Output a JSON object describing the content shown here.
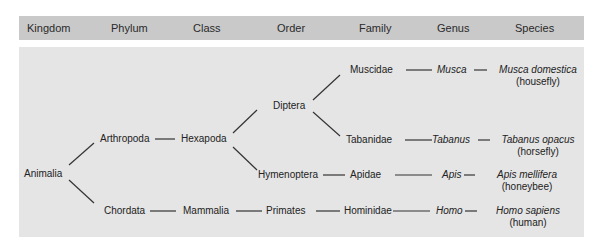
{
  "header": {
    "columns": [
      "Kingdom",
      "Phylum",
      "Class",
      "Order",
      "Family",
      "Genus",
      "Species"
    ]
  },
  "tree": {
    "kingdom": "Animalia",
    "phyla": [
      "Arthropoda",
      "Chordata"
    ],
    "classes": [
      "Hexapoda",
      "Mammalia"
    ],
    "orders": [
      "Diptera",
      "Hymenoptera",
      "Primates"
    ],
    "families": [
      "Muscidae",
      "Tabanidae",
      "Apidae",
      "Hominidae"
    ],
    "genera": [
      "Musca",
      "Tabanus",
      "Apis",
      "Homo"
    ],
    "species": [
      {
        "name": "Musca domestica",
        "common": "(housefly)"
      },
      {
        "name": "Tabanus opacus",
        "common": "(horsefly)"
      },
      {
        "name": "Apis mellifera",
        "common": "(honeybee)"
      },
      {
        "name": "Homo sapiens",
        "common": "(human)"
      }
    ]
  },
  "colors": {
    "header_bg": "#c9c9c9",
    "panel_bg": "#e5e5e5",
    "line": "#333333"
  }
}
